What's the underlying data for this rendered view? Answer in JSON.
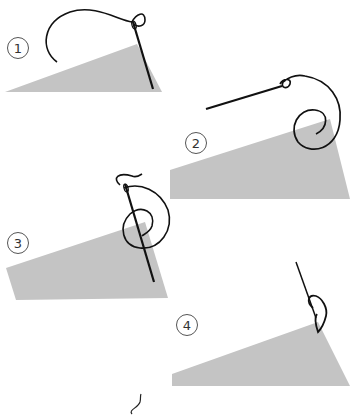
{
  "illustration": {
    "title": "",
    "steps": [
      {
        "number": "1",
        "description": "Needle inserted through fabric corner, thread arcing above"
      },
      {
        "number": "2",
        "description": "Needle pulled out, thread looping around fabric corner"
      },
      {
        "number": "3",
        "description": "Needle passes through thread loop at fabric edge"
      },
      {
        "number": "4",
        "description": "Thread pulled tight forming knot at fabric corner"
      }
    ]
  },
  "colors": {
    "fabric": "#c4c4c4",
    "thread": "#111111",
    "label_border": "#555555",
    "background": "#ffffff"
  }
}
